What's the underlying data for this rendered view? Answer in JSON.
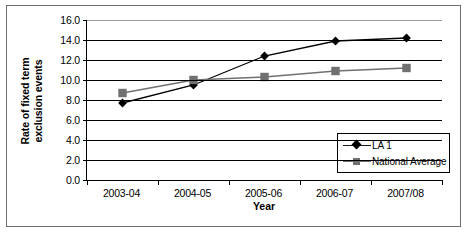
{
  "chart_data": {
    "type": "line",
    "title": "",
    "xlabel": "Year",
    "ylabel": "Rate of fixed term exclusion events",
    "ylabel_line1": "Rate of fixed term",
    "ylabel_line2": "exclusion events",
    "categories": [
      "2003-04",
      "2004-05",
      "2005-06",
      "2006-07",
      "2007/08"
    ],
    "ylim": [
      0.0,
      16.0
    ],
    "ystep": 2.0,
    "yticks": [
      "16.0",
      "14.0",
      "12.0",
      "10.0",
      "8.0",
      "6.0",
      "4.0",
      "2.0",
      "0.0"
    ],
    "ytick_values": [
      16.0,
      14.0,
      12.0,
      10.0,
      8.0,
      6.0,
      4.0,
      2.0,
      0.0
    ],
    "grid": true,
    "legend_position": "bottom-right-inside",
    "series": [
      {
        "name": "LA 1",
        "marker": "diamond",
        "color": "#000000",
        "values": [
          7.7,
          9.5,
          12.4,
          13.9,
          14.2
        ]
      },
      {
        "name": "National Average",
        "marker": "square",
        "color": "#707070",
        "values": [
          8.7,
          10.0,
          10.3,
          10.9,
          11.2
        ]
      }
    ]
  },
  "legend": {
    "items": [
      {
        "label": "LA 1"
      },
      {
        "label": "National Average"
      }
    ]
  },
  "colors": {
    "series_la1": "#000000",
    "series_national": "#707070",
    "axis": "#000000",
    "grid": "#000000",
    "frame": "#6e6e6e",
    "background": "#ffffff"
  }
}
